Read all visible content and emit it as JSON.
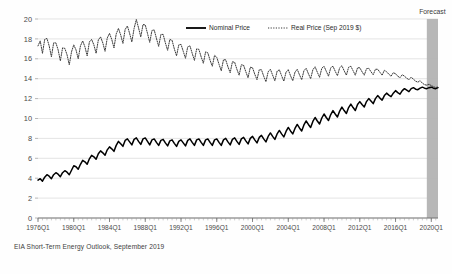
{
  "figure": {
    "background_color": "#fefefe",
    "source_note": "EIA Short-Term Energy Outlook, September 2019",
    "forecast_label": "Forecast",
    "forecast_band_color": "#b3b3b3"
  },
  "chart_data": {
    "type": "line",
    "title": "",
    "subtitle": "",
    "xlabel": "",
    "ylabel": "",
    "ylim": [
      0,
      20
    ],
    "yticks": [
      0,
      2,
      4,
      6,
      8,
      10,
      12,
      14,
      16,
      18,
      20
    ],
    "ytick_labels": [
      "0",
      "2",
      "4",
      "6",
      "8",
      "10",
      "12",
      "14",
      "16",
      "18",
      "20"
    ],
    "grid": true,
    "grid_color": "#d9d9d9",
    "legend_position": "top-center",
    "x_start": "1976Q1",
    "x_end": "2020Q4",
    "xtick_labels": [
      "1976Q1",
      "1980Q1",
      "1984Q1",
      "1988Q1",
      "1992Q1",
      "1996Q1",
      "2000Q1",
      "2004Q1",
      "2008Q1",
      "2012Q1",
      "2016Q1",
      "2020Q1"
    ],
    "forecast_start": "2019Q3",
    "forecast_end": "2020Q4",
    "series": [
      {
        "name": "Nominal Price",
        "style": "solid",
        "color": "#000000",
        "values": [
          3.8,
          3.95,
          3.7,
          4.1,
          4.35,
          4.2,
          3.95,
          4.35,
          4.55,
          4.4,
          4.15,
          4.55,
          4.75,
          4.6,
          4.35,
          4.8,
          5.25,
          5.15,
          4.9,
          5.4,
          5.8,
          5.65,
          5.4,
          5.95,
          6.3,
          6.15,
          5.9,
          6.45,
          6.75,
          6.55,
          6.3,
          6.85,
          7.15,
          6.95,
          6.7,
          7.3,
          7.7,
          7.45,
          7.2,
          7.8,
          7.95,
          7.65,
          7.35,
          7.9,
          8.05,
          7.7,
          7.4,
          7.95,
          8.05,
          7.7,
          7.35,
          7.85,
          7.95,
          7.6,
          7.3,
          7.8,
          7.9,
          7.55,
          7.25,
          7.75,
          7.85,
          7.5,
          7.2,
          7.7,
          7.85,
          7.55,
          7.25,
          7.8,
          7.95,
          7.6,
          7.3,
          7.85,
          7.95,
          7.6,
          7.3,
          7.85,
          7.95,
          7.6,
          7.3,
          7.85,
          7.95,
          7.6,
          7.3,
          7.85,
          8.0,
          7.65,
          7.35,
          7.9,
          8.05,
          7.7,
          7.4,
          7.95,
          8.1,
          7.75,
          7.45,
          8.0,
          8.2,
          7.85,
          7.55,
          8.1,
          8.3,
          7.95,
          7.65,
          8.2,
          8.55,
          8.2,
          7.9,
          8.45,
          8.8,
          8.45,
          8.15,
          8.7,
          9.1,
          8.75,
          8.45,
          9.0,
          9.4,
          9.05,
          8.75,
          9.35,
          9.75,
          9.4,
          9.1,
          9.7,
          10.1,
          9.75,
          9.45,
          10.05,
          10.45,
          10.1,
          9.8,
          10.4,
          10.8,
          10.45,
          10.15,
          10.75,
          11.15,
          10.8,
          10.5,
          11.1,
          11.45,
          11.1,
          10.8,
          11.4,
          11.7,
          11.4,
          11.15,
          11.7,
          12.0,
          11.75,
          11.5,
          12.0,
          12.3,
          12.05,
          11.85,
          12.3,
          12.55,
          12.35,
          12.2,
          12.55,
          12.8,
          12.6,
          12.45,
          12.8,
          13.0,
          12.85,
          12.7,
          13.0,
          13.1,
          12.95,
          12.9,
          13.05,
          13.15,
          13.05,
          13.0,
          13.1,
          13.15,
          13.05,
          13.0,
          13.1
        ]
      },
      {
        "name": "Real Price (Sep 2019 $)",
        "style": "dotted",
        "color": "#3a3a3a",
        "values": [
          17.3,
          17.8,
          16.55,
          17.95,
          18.05,
          17.3,
          16.2,
          17.6,
          17.6,
          16.9,
          15.8,
          17.1,
          17.05,
          16.4,
          15.4,
          16.7,
          17.4,
          16.9,
          16.0,
          17.3,
          17.8,
          17.2,
          16.3,
          17.7,
          17.95,
          17.4,
          16.55,
          17.9,
          18.2,
          17.6,
          16.75,
          18.1,
          18.55,
          17.95,
          17.1,
          18.5,
          19.05,
          18.4,
          17.55,
          18.95,
          19.3,
          18.55,
          17.7,
          19.05,
          19.95,
          19.1,
          18.2,
          19.45,
          19.4,
          18.55,
          17.65,
          18.85,
          18.9,
          18.05,
          17.25,
          18.45,
          18.45,
          17.6,
          16.85,
          17.95,
          17.85,
          17.0,
          16.3,
          17.4,
          17.45,
          16.75,
          16.05,
          17.2,
          17.3,
          16.55,
          15.85,
          17.0,
          16.95,
          16.2,
          15.55,
          16.7,
          16.6,
          15.85,
          15.25,
          16.35,
          16.15,
          15.45,
          14.8,
          15.9,
          15.9,
          15.2,
          14.6,
          15.7,
          15.65,
          14.95,
          14.35,
          15.4,
          15.35,
          14.7,
          14.1,
          15.15,
          15.1,
          14.45,
          13.9,
          14.9,
          14.9,
          14.25,
          13.7,
          14.7,
          14.95,
          14.35,
          13.8,
          14.75,
          14.9,
          14.3,
          13.75,
          14.65,
          14.9,
          14.3,
          13.8,
          14.65,
          14.95,
          14.4,
          13.9,
          14.8,
          15.05,
          14.5,
          14.0,
          14.9,
          15.2,
          14.65,
          14.15,
          15.05,
          15.25,
          14.75,
          14.25,
          15.1,
          15.25,
          14.75,
          14.3,
          15.1,
          15.3,
          14.8,
          14.35,
          15.15,
          15.25,
          14.8,
          14.35,
          15.1,
          15.1,
          14.7,
          14.35,
          15.0,
          15.05,
          14.7,
          14.4,
          14.95,
          14.95,
          14.65,
          14.35,
          14.85,
          14.7,
          14.45,
          14.25,
          14.6,
          14.5,
          14.25,
          14.1,
          14.4,
          14.25,
          14.05,
          13.9,
          14.15,
          13.95,
          13.75,
          13.65,
          13.8,
          13.55,
          13.4,
          13.35,
          13.45,
          13.3,
          13.2,
          13.1,
          13.2
        ]
      }
    ]
  }
}
